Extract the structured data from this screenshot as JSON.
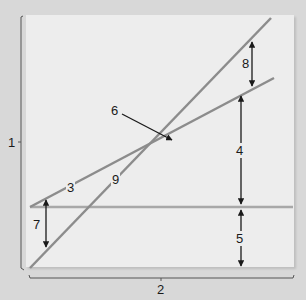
{
  "diagram": {
    "axis_labels": {
      "y": "1",
      "x": "2"
    },
    "line_labels": {
      "shallow_line": "3",
      "steep_line": "9"
    },
    "gap_labels": {
      "upper_gap": "8",
      "middle_gap": "4",
      "lower_gap": "5",
      "left_gap": "7"
    },
    "pointer_label": "6",
    "colors": {
      "background": "#d8d8d8",
      "panel": "#ededed",
      "line": "#8c8c8c",
      "horizontal_line": "#a8a8a8",
      "arrow": "#1a1a1a"
    }
  }
}
